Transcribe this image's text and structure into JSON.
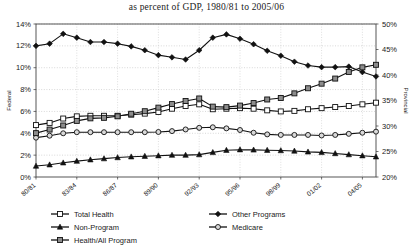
{
  "chart_data": {
    "type": "line",
    "title": "as percent of GDP, 1980/81 to 2005/06",
    "xlabel": "",
    "ylabel": "Federal",
    "y2label": "Provincial",
    "ylim": [
      0,
      14
    ],
    "y2lim": [
      20,
      50
    ],
    "grid": true,
    "legend_position": "bottom",
    "yticks": [
      "0%",
      "2%",
      "4%",
      "6%",
      "8%",
      "10%",
      "12%",
      "14%"
    ],
    "y2ticks": [
      "20%",
      "25%",
      "30%",
      "35%",
      "40%",
      "45%",
      "50%"
    ],
    "x": [
      "80/81",
      "81/82",
      "82/83",
      "83/84",
      "84/85",
      "85/86",
      "86/87",
      "87/88",
      "88/89",
      "89/90",
      "90/91",
      "91/92",
      "92/93",
      "93/94",
      "94/95",
      "95/96",
      "96/97",
      "97/98",
      "98/99",
      "99/00",
      "00/01",
      "01/02",
      "02/03",
      "03/04",
      "04/05",
      "05/06"
    ],
    "xtick_labels": [
      "80/81",
      "83/84",
      "86/87",
      "89/90",
      "92/93",
      "95/96",
      "98/99",
      "01/02",
      "04/05"
    ],
    "xtick_indices": [
      0,
      3,
      6,
      9,
      12,
      15,
      18,
      21,
      24
    ],
    "series": [
      {
        "name": "Total Health",
        "marker": "open-square",
        "color": "#1a1a1a",
        "axis": "left",
        "values": [
          4.75,
          4.95,
          5.35,
          5.55,
          5.6,
          5.6,
          5.6,
          5.7,
          5.8,
          5.95,
          6.25,
          6.5,
          6.65,
          6.2,
          6.25,
          6.3,
          6.25,
          6.1,
          6.0,
          6.05,
          6.2,
          6.3,
          6.4,
          6.5,
          6.65,
          6.8
        ]
      },
      {
        "name": "Other Programs",
        "marker": "filled-diamond",
        "color": "#111111",
        "axis": "left",
        "values": [
          12.0,
          12.2,
          13.1,
          12.75,
          12.35,
          12.35,
          12.2,
          11.95,
          11.6,
          11.15,
          10.95,
          10.75,
          11.6,
          12.75,
          13.05,
          12.65,
          12.15,
          11.55,
          11.1,
          10.55,
          10.2,
          10.05,
          10.05,
          10.1,
          9.6,
          9.2
        ]
      },
      {
        "name": "Non-Program",
        "marker": "filled-triangle",
        "color": "#111111",
        "axis": "left",
        "values": [
          1.0,
          1.12,
          1.3,
          1.45,
          1.58,
          1.68,
          1.78,
          1.85,
          1.9,
          1.95,
          2.0,
          2.0,
          2.05,
          2.25,
          2.45,
          2.5,
          2.48,
          2.45,
          2.42,
          2.38,
          2.3,
          2.25,
          2.15,
          2.05,
          1.95,
          1.85
        ]
      },
      {
        "name": "Medicare",
        "marker": "open-circle",
        "color": "#333333",
        "axis": "left",
        "values": [
          3.6,
          3.78,
          4.0,
          4.1,
          4.1,
          4.1,
          4.1,
          4.1,
          4.1,
          4.12,
          4.2,
          4.35,
          4.5,
          4.55,
          4.45,
          4.3,
          4.05,
          3.9,
          3.85,
          3.85,
          3.85,
          3.8,
          3.85,
          3.95,
          4.05,
          4.15
        ]
      },
      {
        "name": "Health/All Program",
        "marker": "gray-square",
        "color": "#555555",
        "axis": "right",
        "values": [
          28.6,
          29.3,
          30.1,
          31.0,
          31.5,
          31.6,
          31.9,
          32.4,
          32.9,
          33.6,
          34.3,
          34.9,
          35.4,
          33.8,
          33.7,
          34.0,
          34.5,
          35.2,
          35.5,
          36.4,
          37.4,
          38.3,
          39.3,
          40.6,
          41.5,
          42.0
        ]
      }
    ],
    "legend": [
      {
        "label": "Total Health",
        "marker": "open-square"
      },
      {
        "label": "Other Programs",
        "marker": "filled-diamond"
      },
      {
        "label": "Non-Program",
        "marker": "filled-triangle"
      },
      {
        "label": "Medicare",
        "marker": "open-circle"
      },
      {
        "label": "Health/All Program",
        "marker": "gray-square"
      }
    ]
  }
}
